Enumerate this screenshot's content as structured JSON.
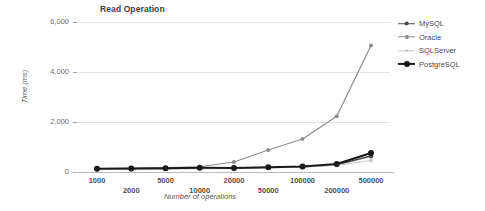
{
  "chart_data": {
    "type": "line",
    "title": "Read Operation",
    "xlabel": "Number of operations",
    "ylabel": "Time (ms)",
    "categories": [
      "1000",
      "2000",
      "5000",
      "10000",
      "20000",
      "50000",
      "100000",
      "200000",
      "500000"
    ],
    "ytick_labels": [
      "0",
      "2,000",
      "4,000",
      "6,000"
    ],
    "ytick_values": [
      0,
      2000,
      4000,
      6000
    ],
    "ylim": [
      0,
      6000
    ],
    "grid": true,
    "legend_position": "right",
    "series": [
      {
        "name": "MySQL",
        "color": "#4a4a4a",
        "values": [
          120,
          130,
          140,
          155,
          150,
          175,
          205,
          290,
          640
        ]
      },
      {
        "name": "Oracle",
        "color": "#8c8c8c",
        "values": [
          140,
          150,
          175,
          210,
          400,
          880,
          1320,
          2230,
          5060
        ]
      },
      {
        "name": "SQLServer",
        "color": "#c9c9c9",
        "values": [
          110,
          115,
          125,
          135,
          145,
          165,
          195,
          270,
          460
        ]
      },
      {
        "name": "PostgreSQL",
        "color": "#1a1a1a",
        "values": [
          130,
          140,
          150,
          170,
          160,
          190,
          225,
          320,
          760
        ]
      }
    ]
  }
}
